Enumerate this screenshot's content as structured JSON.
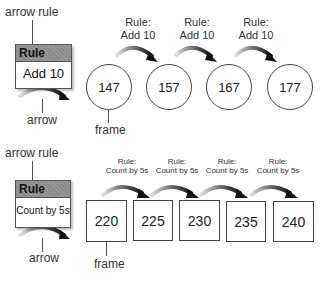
{
  "diagram_top": {
    "legend": {
      "top_label": "arrow rule",
      "header": "Rule",
      "body": "Add 10",
      "bottom_label": "arrow"
    },
    "frames": [
      "147",
      "157",
      "167",
      "177"
    ],
    "frame_shape": "circle",
    "frame_label": "frame",
    "rules": [
      {
        "line1": "Rule:",
        "line2": "Add 10"
      },
      {
        "line1": "Rule:",
        "line2": "Add 10"
      },
      {
        "line1": "Rule:",
        "line2": "Add 10"
      }
    ]
  },
  "diagram_bottom": {
    "legend": {
      "top_label": "arrow rule",
      "header": "Rule",
      "body": "Count by 5s",
      "bottom_label": "arrow"
    },
    "frames": [
      "220",
      "225",
      "230",
      "235",
      "240"
    ],
    "frame_shape": "square",
    "frame_label": "frame",
    "rules": [
      {
        "line1": "Rule:",
        "line2": "Count by 5s"
      },
      {
        "line1": "Rule:",
        "line2": "Count by 5s"
      },
      {
        "line1": "Rule:",
        "line2": "Count by 5s"
      },
      {
        "line1": "Rule:",
        "line2": "Count by 5s"
      }
    ]
  },
  "colors": {
    "rule_header": "#8c8c8c",
    "outline": "#444444",
    "arrow_start": "#d0d0d0",
    "arrow_end": "#111111"
  }
}
